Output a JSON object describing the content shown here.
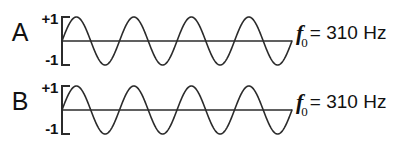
{
  "figure": {
    "background_color": "#ffffff",
    "stroke_color": "#2b2b2b",
    "text_color": "#111111"
  },
  "rows": [
    {
      "letter": "A",
      "axis_top_label": "+1",
      "axis_bottom_label": "-1",
      "freq_symbol": "f",
      "freq_subscript": "0",
      "freq_value": "= 310 Hz"
    },
    {
      "letter": "B",
      "axis_top_label": "+1",
      "axis_bottom_label": "-1",
      "freq_symbol": "f",
      "freq_subscript": "0",
      "freq_value": "= 310 Hz"
    }
  ],
  "chart_data": {
    "type": "line",
    "title": "",
    "xlabel": "",
    "ylabel": "",
    "ylim": [
      -1,
      1
    ],
    "grid": false,
    "legend": "none",
    "y_tick_labels": [
      "+1",
      "-1"
    ],
    "y_ticks": [
      1,
      -1
    ],
    "series": [
      {
        "name": "A",
        "waveform": "sine",
        "amplitude": 1,
        "cycles": 4,
        "phase_deg": 0,
        "frequency_hz": 310,
        "frequency_label": "f0 = 310 Hz"
      },
      {
        "name": "B",
        "waveform": "sine",
        "amplitude": 1,
        "cycles": 4,
        "phase_deg": 0,
        "frequency_hz": 310,
        "frequency_label": "f0 = 310 Hz"
      }
    ]
  }
}
